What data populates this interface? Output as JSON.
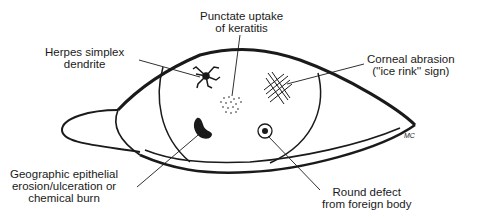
{
  "figure": {
    "signature": "MC",
    "caption_partial": "",
    "labels": {
      "herpes": {
        "line1": "Herpes simplex",
        "line2": "dendrite"
      },
      "punctate": {
        "line1": "Punctate uptake",
        "line2": "of keratitis"
      },
      "abrasion": {
        "line1": "Corneal abrasion",
        "line2": "(''ice rink'' sign)"
      },
      "geographic": {
        "line1": "Geographic epithelial",
        "line2": "erosion/ulceration or",
        "line3": "chemical burn"
      },
      "foreign_body": {
        "line1": "Round defect",
        "line2": "from foreign body"
      }
    }
  },
  "colors": {
    "ink": "#1a1a1a",
    "background": "#ffffff"
  }
}
